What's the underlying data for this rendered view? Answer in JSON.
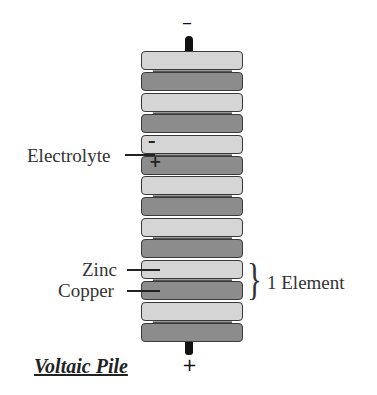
{
  "diagram": {
    "title": "Voltaic Pile",
    "top_terminal_sign": "–",
    "bottom_terminal_sign": "+",
    "plates": [
      "zinc",
      "copper",
      "zinc",
      "copper",
      "zinc",
      "copper",
      "zinc",
      "copper",
      "zinc",
      "copper",
      "zinc",
      "copper",
      "zinc",
      "copper"
    ],
    "colors": {
      "zinc": "#d5d5d5",
      "copper": "#8c8c8c",
      "electrolyte": "#9a9a9a",
      "terminal": "#111111"
    },
    "labels": {
      "electrolyte": "Electrolyte",
      "zinc": "Zinc",
      "copper": "Copper",
      "element": "1 Element"
    },
    "plate_signs": {
      "minus": "–",
      "plus": "+"
    },
    "brace": "}"
  }
}
